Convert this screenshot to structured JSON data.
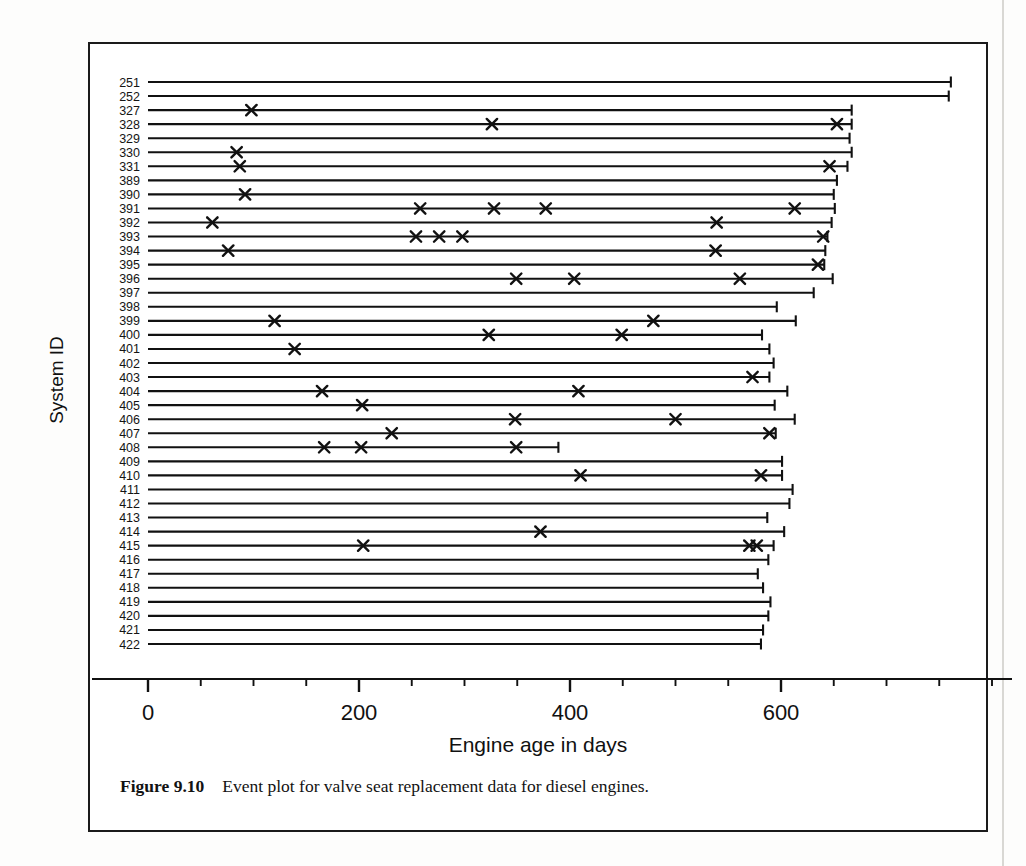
{
  "figure": {
    "number_label": "Figure 9.10",
    "caption_text": "Event plot for valve seat replacement data for diesel engines."
  },
  "chart_data": {
    "type": "event_plot",
    "title": "",
    "xlabel": "Engine age in days",
    "ylabel": "System ID",
    "xlim": [
      0,
      780
    ],
    "xticks": [
      0,
      200,
      400,
      600
    ],
    "xtick_labels": [
      "0",
      "200",
      "400",
      "600"
    ],
    "xminor_step": 50,
    "grid": false,
    "legend": null,
    "marker": "x",
    "series_note": "Each horizontal line is one diesel engine system observed from day 0 to its censoring time; x markers are valve seat replacement events.",
    "categories": [
      "251",
      "252",
      "327",
      "328",
      "329",
      "330",
      "331",
      "389",
      "390",
      "391",
      "392",
      "393",
      "394",
      "395",
      "396",
      "397",
      "398",
      "399",
      "400",
      "401",
      "402",
      "403",
      "404",
      "405",
      "406",
      "407",
      "408",
      "409",
      "410",
      "411",
      "412",
      "413",
      "414",
      "415",
      "416",
      "417",
      "418",
      "419",
      "420",
      "421",
      "422"
    ],
    "systems": [
      {
        "id": "251",
        "censor_time": 761,
        "events": []
      },
      {
        "id": "252",
        "censor_time": 759,
        "events": []
      },
      {
        "id": "327",
        "censor_time": 667,
        "events": [
          98
        ]
      },
      {
        "id": "328",
        "censor_time": 667,
        "events": [
          326,
          653
        ]
      },
      {
        "id": "329",
        "censor_time": 665,
        "events": []
      },
      {
        "id": "330",
        "censor_time": 667,
        "events": [
          84
        ]
      },
      {
        "id": "331",
        "censor_time": 663,
        "events": [
          87,
          646
        ]
      },
      {
        "id": "389",
        "censor_time": 653,
        "events": []
      },
      {
        "id": "390",
        "censor_time": 650,
        "events": [
          92
        ]
      },
      {
        "id": "391",
        "censor_time": 651,
        "events": [
          258,
          328,
          377,
          613
        ]
      },
      {
        "id": "392",
        "censor_time": 648,
        "events": [
          61,
          539
        ]
      },
      {
        "id": "393",
        "censor_time": 644,
        "events": [
          254,
          276,
          298,
          640
        ]
      },
      {
        "id": "394",
        "censor_time": 642,
        "events": [
          76,
          538
        ]
      },
      {
        "id": "395",
        "censor_time": 641,
        "events": [
          635
        ]
      },
      {
        "id": "396",
        "censor_time": 649,
        "events": [
          349,
          404,
          561
        ]
      },
      {
        "id": "397",
        "censor_time": 631,
        "events": []
      },
      {
        "id": "398",
        "censor_time": 596,
        "events": []
      },
      {
        "id": "399",
        "censor_time": 614,
        "events": [
          120,
          479
        ]
      },
      {
        "id": "400",
        "censor_time": 582,
        "events": [
          323,
          449
        ]
      },
      {
        "id": "401",
        "censor_time": 589,
        "events": [
          139
        ]
      },
      {
        "id": "402",
        "censor_time": 593,
        "events": []
      },
      {
        "id": "403",
        "censor_time": 589,
        "events": [
          573
        ]
      },
      {
        "id": "404",
        "censor_time": 606,
        "events": [
          165,
          408
        ]
      },
      {
        "id": "405",
        "censor_time": 594,
        "events": [
          203
        ]
      },
      {
        "id": "406",
        "censor_time": 613,
        "events": [
          348,
          500
        ]
      },
      {
        "id": "407",
        "censor_time": 595,
        "events": [
          231,
          589
        ]
      },
      {
        "id": "408",
        "censor_time": 389,
        "events": [
          167,
          202,
          349
        ]
      },
      {
        "id": "409",
        "censor_time": 601,
        "events": []
      },
      {
        "id": "410",
        "censor_time": 601,
        "events": [
          410,
          581
        ]
      },
      {
        "id": "411",
        "censor_time": 611,
        "events": []
      },
      {
        "id": "412",
        "censor_time": 608,
        "events": []
      },
      {
        "id": "413",
        "censor_time": 587,
        "events": []
      },
      {
        "id": "414",
        "censor_time": 603,
        "events": [
          372
        ]
      },
      {
        "id": "415",
        "censor_time": 593,
        "events": [
          204,
          570,
          577
        ]
      },
      {
        "id": "416",
        "censor_time": 588,
        "events": []
      },
      {
        "id": "417",
        "censor_time": 578,
        "events": []
      },
      {
        "id": "418",
        "censor_time": 583,
        "events": []
      },
      {
        "id": "419",
        "censor_time": 590,
        "events": []
      },
      {
        "id": "420",
        "censor_time": 588,
        "events": []
      },
      {
        "id": "421",
        "censor_time": 583,
        "events": []
      },
      {
        "id": "422",
        "censor_time": 581,
        "events": []
      }
    ]
  },
  "colors": {
    "ink": "#111111",
    "paper": "#ffffff",
    "page_border": "#1b1b1b"
  }
}
